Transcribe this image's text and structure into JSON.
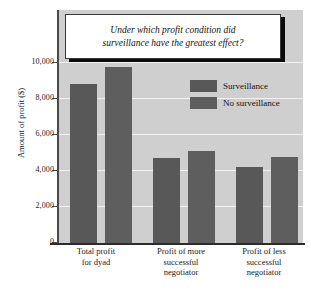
{
  "chart_data": {
    "type": "bar",
    "title": "Under which profit condition did surveillance have the greatest effect?",
    "title_line1": "Under which profit condition did",
    "title_line2": "surveillance have the greatest effect?",
    "xlabel": "",
    "ylabel": "Amount of profit ($)",
    "ylim": [
      0,
      10000
    ],
    "ytick_labels": [
      "10,000",
      "8,000",
      "6,000",
      "4,000",
      "2,000",
      "0"
    ],
    "ytick_values": [
      10000,
      8000,
      6000,
      4000,
      2000,
      0
    ],
    "grid": true,
    "legend_position": "top-right",
    "categories": [
      "Total profit for dyad",
      "Profit of more successful negotiator",
      "Profit of less successful negotiator"
    ],
    "category_lines": [
      [
        "Total profit",
        "for dyad"
      ],
      [
        "Profit of more",
        "successful",
        "negotiator"
      ],
      [
        "Profit of less",
        "successful",
        "negotiator"
      ]
    ],
    "series": [
      {
        "name": "Surveillance",
        "color": "#585858",
        "values": [
          8800,
          4700,
          4200
        ]
      },
      {
        "name": "No surveillance",
        "color": "#5e5e5e",
        "values": [
          9700,
          5100,
          4750
        ]
      }
    ],
    "plot_background": "#cfcfcf",
    "gridline_color": "#f2f2f2",
    "axis_color": "#2b2b2b"
  }
}
